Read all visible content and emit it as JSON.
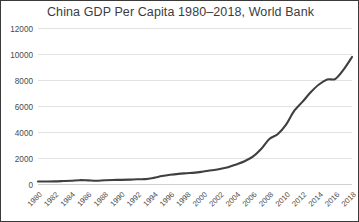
{
  "chart_data": {
    "type": "line",
    "title": "China GDP Per Capita 1980–2018, World Bank",
    "xlabel": "",
    "ylabel": "",
    "grid": true,
    "legend": false,
    "ylim": [
      0,
      12000
    ],
    "yticks": [
      0,
      2000,
      4000,
      6000,
      8000,
      10000,
      12000
    ],
    "ytick_labels": [
      "0",
      "2000",
      "4000",
      "6000",
      "8000",
      "10000",
      "12000"
    ],
    "xlim": [
      1980,
      2018
    ],
    "xticks": [
      1980,
      1982,
      1984,
      1986,
      1988,
      1990,
      1992,
      1994,
      1996,
      1998,
      2000,
      2002,
      2004,
      2006,
      2008,
      2010,
      2012,
      2014,
      2016,
      2018
    ],
    "xtick_labels": [
      "1980",
      "1982",
      "1984",
      "1986",
      "1988",
      "1990",
      "1992",
      "1994",
      "1996",
      "1998",
      "2000",
      "2002",
      "2004",
      "2006",
      "2008",
      "2010",
      "2012",
      "2014",
      "2016",
      "2018"
    ],
    "x": [
      1980,
      1981,
      1982,
      1983,
      1984,
      1985,
      1986,
      1987,
      1988,
      1989,
      1990,
      1991,
      1992,
      1993,
      1994,
      1995,
      1996,
      1997,
      1998,
      1999,
      2000,
      2001,
      2002,
      2003,
      2004,
      2005,
      2006,
      2007,
      2008,
      2009,
      2010,
      2011,
      2012,
      2013,
      2014,
      2015,
      2016,
      2017,
      2018
    ],
    "values": [
      195,
      197,
      203,
      225,
      250,
      294,
      282,
      252,
      284,
      311,
      318,
      333,
      366,
      377,
      473,
      609,
      709,
      781,
      828,
      873,
      959,
      1053,
      1149,
      1288,
      1508,
      1753,
      2099,
      2693,
      3468,
      3832,
      4550,
      5618,
      6317,
      7051,
      7651,
      8034,
      8094,
      8817,
      9771
    ],
    "series_name": "GDP per capita (current US$)",
    "line_color": "#3f3f3f",
    "gridline_color": "#e2e2e2",
    "axis_color": "#d0d0d0",
    "text_color": "#4a4a4a",
    "background_color": "#ffffff",
    "border_color": "#3a3a3a"
  }
}
